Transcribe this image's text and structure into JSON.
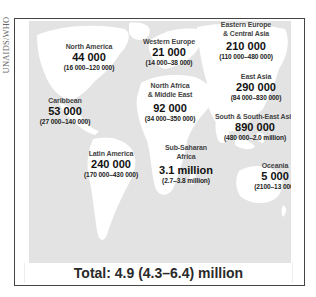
{
  "source_label": "UNAIDS/WHO",
  "colors": {
    "ocean": "#e3e3e3",
    "land": "#ffffff",
    "frame": "#444444",
    "text": "#111111"
  },
  "regions": [
    {
      "name": "North America",
      "value": "44 000",
      "range": "(16 000–120 000)"
    },
    {
      "name": "Caribbean",
      "value": "53 000",
      "range": "(27 000–140 000)"
    },
    {
      "name": "Latin America",
      "value": "240 000",
      "range": "(170 000–430 000)"
    },
    {
      "name": "Western Europe",
      "value": "21 000",
      "range": "(14 000–38 000)"
    },
    {
      "name": "North Africa\n& Middle East",
      "name_line1": "North Africa",
      "name_line2": "& Middle East",
      "value": "92 000",
      "range": "(34 000–350 000)"
    },
    {
      "name": "Sub-Saharan Africa",
      "name_line1": "Sub-Saharan",
      "name_line2": "Africa",
      "value": "3.1 million",
      "range": "(2.7–3.8 million)"
    },
    {
      "name": "Eastern Europe & Central Asia",
      "name_line1": "Eastern Europe",
      "name_line2": "& Central Asia",
      "value": "210 000",
      "range": "(110 000–480 000)"
    },
    {
      "name": "East Asia",
      "value": "290 000",
      "range": "(84 000–830 000)"
    },
    {
      "name": "South & South-East Asia",
      "value": "890 000",
      "range": "(480 000–2.0 million)"
    },
    {
      "name": "Oceania",
      "value": "5 000",
      "range": "(2100–13 000)"
    }
  ],
  "total": "Total: 4.9 (4.3–6.4) million"
}
